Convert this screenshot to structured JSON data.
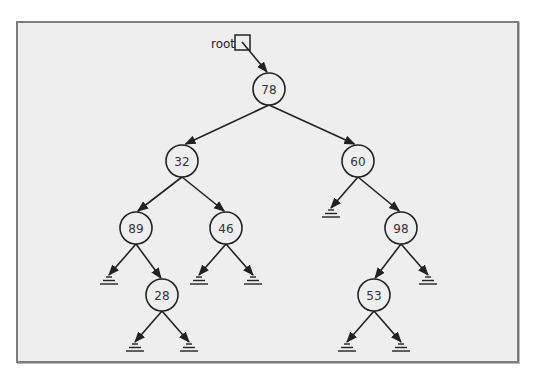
{
  "diagram": {
    "type": "binary-tree",
    "root_pointer": {
      "label": "root",
      "points_to": "78"
    },
    "nodes": [
      {
        "id": "n78",
        "value": "78",
        "x": 269,
        "y": 89
      },
      {
        "id": "n32",
        "value": "32",
        "x": 182,
        "y": 161
      },
      {
        "id": "n60",
        "value": "60",
        "x": 358,
        "y": 161
      },
      {
        "id": "n89",
        "value": "89",
        "x": 136,
        "y": 228
      },
      {
        "id": "n46",
        "value": "46",
        "x": 226,
        "y": 228
      },
      {
        "id": "n98",
        "value": "98",
        "x": 401,
        "y": 228
      },
      {
        "id": "n28",
        "value": "28",
        "x": 162,
        "y": 295
      },
      {
        "id": "n53",
        "value": "53",
        "x": 374,
        "y": 295
      }
    ],
    "edges": [
      {
        "from": "78",
        "to": "32",
        "side": "left"
      },
      {
        "from": "78",
        "to": "60",
        "side": "right"
      },
      {
        "from": "32",
        "to": "89",
        "side": "left"
      },
      {
        "from": "32",
        "to": "46",
        "side": "right"
      },
      {
        "from": "60",
        "to": "null",
        "side": "left"
      },
      {
        "from": "60",
        "to": "98",
        "side": "right"
      },
      {
        "from": "89",
        "to": "null",
        "side": "left"
      },
      {
        "from": "89",
        "to": "28",
        "side": "right"
      },
      {
        "from": "46",
        "to": "null",
        "side": "left"
      },
      {
        "from": "46",
        "to": "null",
        "side": "right"
      },
      {
        "from": "98",
        "to": "53",
        "side": "left"
      },
      {
        "from": "98",
        "to": "null",
        "side": "right"
      },
      {
        "from": "28",
        "to": "null",
        "side": "left"
      },
      {
        "from": "28",
        "to": "null",
        "side": "right"
      },
      {
        "from": "53",
        "to": "null",
        "side": "left"
      },
      {
        "from": "53",
        "to": "null",
        "side": "right"
      }
    ],
    "colors": {
      "background": "#eeeeee",
      "stroke": "#222222",
      "frame": "#7d7d7d",
      "node_fill": "#eeeeee"
    }
  }
}
